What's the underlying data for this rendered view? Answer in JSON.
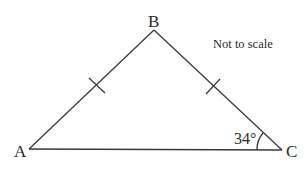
{
  "diagram": {
    "type": "isosceles-triangle",
    "vertices": [
      {
        "label": "A",
        "x": 29,
        "y": 149
      },
      {
        "label": "B",
        "x": 154,
        "y": 30
      },
      {
        "label": "C",
        "x": 282,
        "y": 150
      }
    ],
    "equal_sides": [
      "AB",
      "BC"
    ],
    "angle": {
      "vertex": "C",
      "label": "34°"
    },
    "note": "Not to scale"
  }
}
